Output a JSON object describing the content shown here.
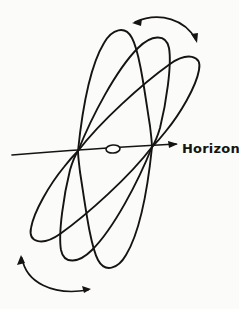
{
  "figure": {
    "kind": "hand-drawn-astronomy-diagram",
    "background_color": "#fbfbfa",
    "ink_color": "#161412",
    "width": 239,
    "height": 309
  },
  "labels": {
    "horizon": "Horizon"
  },
  "axis": {
    "name": "horizon-line",
    "start": [
      12,
      155
    ],
    "end": [
      178,
      144
    ],
    "has_arrowhead": true,
    "arrow_end": "right"
  },
  "nodes": {
    "left": {
      "name": "descending-node",
      "x": 78,
      "y": 151
    },
    "right": {
      "name": "ascending-node",
      "x": 152,
      "y": 147
    }
  },
  "observer_marker": {
    "name": "celestial-body-marker",
    "shape": "ellipse",
    "cx": 113,
    "cy": 149,
    "rx": 7,
    "ry": 4
  },
  "orbits": [
    {
      "name": "orbit-loop-1",
      "description": "leftmost / steepest inclined loop",
      "top_apex": [
        119,
        30
      ],
      "bottom_apex": [
        34,
        252
      ]
    },
    {
      "name": "orbit-loop-2",
      "description": "middle inclined loop",
      "top_apex": [
        158,
        36
      ],
      "bottom_apex": [
        67,
        265
      ]
    },
    {
      "name": "orbit-loop-3",
      "description": "rightmost / shallowest inclined loop",
      "top_apex": [
        194,
        50
      ],
      "bottom_apex": [
        103,
        268
      ]
    }
  ],
  "motion_arcs": [
    {
      "name": "upper-precession-arc",
      "position": "top",
      "double_headed": true,
      "arrow_directions": [
        "left",
        "right"
      ]
    },
    {
      "name": "lower-precession-arc",
      "position": "bottom",
      "double_headed": true,
      "arrow_directions": [
        "left",
        "right"
      ]
    }
  ]
}
